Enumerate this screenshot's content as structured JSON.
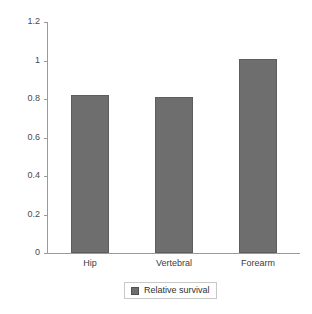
{
  "chart_data": {
    "type": "bar",
    "title": "",
    "subtitle": "",
    "xlabel": "",
    "ylabel": "",
    "categories": [
      "Hip",
      "Vertebral",
      "Forearm"
    ],
    "values": [
      0.82,
      0.81,
      1.01
    ],
    "series": [
      {
        "name": "Relative survival",
        "values": [
          0.82,
          0.81,
          1.01
        ],
        "color": "#6e6e6e"
      }
    ],
    "ylim": [
      0,
      1.2
    ],
    "yticks": [
      0,
      0.2,
      0.4,
      0.6,
      0.8,
      1,
      1.2
    ],
    "ytick_labels": [
      "0",
      "0.2",
      "0.4",
      "0.6",
      "0.8",
      "1",
      "1.2"
    ],
    "grid": false,
    "legend_position": "bottom",
    "legend_entries": [
      "Relative survival"
    ],
    "annotations": []
  },
  "axes": {
    "y_ticks": [
      {
        "label": "1.2",
        "value": 1.2
      },
      {
        "label": "1",
        "value": 1.0
      },
      {
        "label": "0.8",
        "value": 0.8
      },
      {
        "label": "0.6",
        "value": 0.6
      },
      {
        "label": "0.4",
        "value": 0.4
      },
      {
        "label": "0.2",
        "value": 0.2
      },
      {
        "label": "0",
        "value": 0.0
      }
    ],
    "x_categories": [
      "Hip",
      "Vertebral",
      "Forearm"
    ]
  },
  "legend": {
    "swatch_name": "legend-color-swatch",
    "label": "Relative survival"
  },
  "colors": {
    "bar_fill": "#6e6e6e",
    "bar_stroke": "#5d5d5d",
    "axis_line": "#9a9a9a",
    "tick_text": "#4a4a4a",
    "category_text": "#3d3d3d",
    "legend_border": "#c8c8c8",
    "background": "#ffffff"
  }
}
